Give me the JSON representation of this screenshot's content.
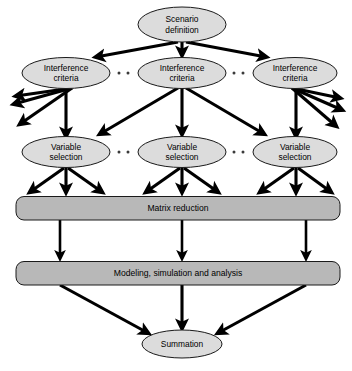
{
  "diagram": {
    "colors": {
      "ellipse_fill": "#dcdcdc",
      "bar_fill": "#b8b8b8",
      "outline": "#1a1a1a",
      "arrow": "#000000",
      "background": "#ffffff"
    },
    "nodes": {
      "scenario": {
        "label_line1": "Scenario",
        "label_line2": "definition",
        "shape": "ellipse"
      },
      "interference_left": {
        "label_line1": "Interference",
        "label_line2": "criteria",
        "shape": "ellipse"
      },
      "interference_middle": {
        "label_line1": "Interference",
        "label_line2": "criteria",
        "shape": "ellipse"
      },
      "interference_right": {
        "label_line1": "Interference",
        "label_line2": "criteria",
        "shape": "ellipse"
      },
      "variable_left": {
        "label_line1": "Variable",
        "label_line2": "selection",
        "shape": "ellipse"
      },
      "variable_middle": {
        "label_line1": "Variable",
        "label_line2": "selection",
        "shape": "ellipse"
      },
      "variable_right": {
        "label_line1": "Variable",
        "label_line2": "selection",
        "shape": "ellipse"
      },
      "matrix_reduction": {
        "label": "Matrix reduction",
        "shape": "rounded-bar"
      },
      "modeling": {
        "label": "Modeling, simulation and analysis",
        "shape": "rounded-bar"
      },
      "summation": {
        "label": "Summation",
        "shape": "ellipse"
      }
    },
    "ellipsis_groups": [
      {
        "name": "interference-gap-left",
        "dots": 3
      },
      {
        "name": "interference-gap-right",
        "dots": 3
      },
      {
        "name": "variable-gap-left",
        "dots": 3
      },
      {
        "name": "variable-gap-right",
        "dots": 3
      }
    ]
  }
}
